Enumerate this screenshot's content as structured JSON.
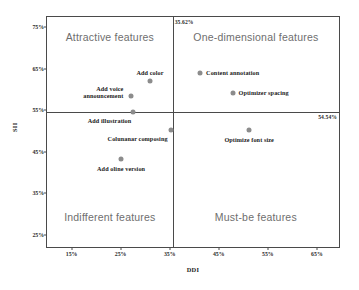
{
  "chart_data": {
    "type": "scatter",
    "title": "",
    "xlabel": "DDI",
    "ylabel": "SII",
    "xlim": [
      0.1,
      0.695
    ],
    "ylim": [
      0.22,
      0.775
    ],
    "xticks": [
      "15%",
      "25%",
      "35%",
      "45%",
      "55%",
      "65%"
    ],
    "xtick_values": [
      0.15,
      0.25,
      0.35,
      0.45,
      0.55,
      0.65
    ],
    "yticks": [
      "75%",
      "65%",
      "55%",
      "45%",
      "35%",
      "25%"
    ],
    "ytick_values": [
      0.75,
      0.65,
      0.55,
      0.45,
      0.35,
      0.25
    ],
    "grid": false,
    "legend": "none",
    "marker_color": "#8c8c8c",
    "frame_color": "#4a4a4a",
    "quadrant_label_color": "#6e6e6e",
    "dividers": {
      "vertical_x": 0.3562,
      "vertical_label": "35.62%",
      "horizontal_y": 0.5454,
      "horizontal_label": "54.54%"
    },
    "quadrants": [
      {
        "name": "attractive",
        "label": "Attractive features"
      },
      {
        "name": "one-dimensional",
        "label": "One-dimensional features"
      },
      {
        "name": "indifferent",
        "label": "Indifferent features"
      },
      {
        "name": "must-be",
        "label": "Must-be features"
      }
    ],
    "points": [
      {
        "label": "Add color",
        "x": 0.31,
        "y": 0.62,
        "label_dx": 0,
        "label_dy": -8,
        "label_align": "center"
      },
      {
        "label": "Add voice",
        "x": 0.272,
        "y": 0.585,
        "label_dx": -8,
        "label_dy": -7,
        "label_align": "right"
      },
      {
        "label": "announcement",
        "x": 0.272,
        "y": 0.585,
        "label_dx": -8,
        "label_dy": 0,
        "label_align": "right"
      },
      {
        "label": "Add illustration",
        "x": 0.276,
        "y": 0.545,
        "label_dx": -2,
        "label_dy": 9,
        "label_align": "right"
      },
      {
        "label": "Colunanar composing",
        "x": 0.352,
        "y": 0.503,
        "label_dx": -3,
        "label_dy": 9,
        "label_align": "right"
      },
      {
        "label": "Add oline version",
        "x": 0.251,
        "y": 0.432,
        "label_dx": 0,
        "label_dy": 10,
        "label_align": "center"
      },
      {
        "label": "Content annotation",
        "x": 0.412,
        "y": 0.64,
        "label_dx": 6,
        "label_dy": 0,
        "label_align": "left"
      },
      {
        "label": "Optimizer spacing",
        "x": 0.478,
        "y": 0.592,
        "label_dx": 6,
        "label_dy": 0,
        "label_align": "left"
      },
      {
        "label": "Optimize font size",
        "x": 0.512,
        "y": 0.503,
        "label_dx": 0,
        "label_dy": 10,
        "label_align": "center"
      }
    ]
  }
}
